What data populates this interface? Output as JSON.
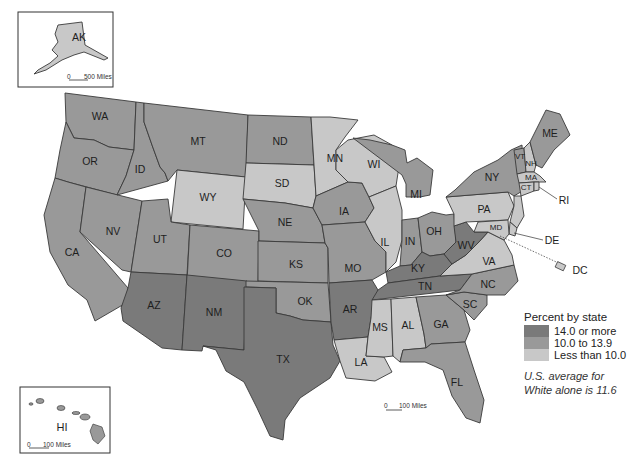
{
  "colors": {
    "high": "#7a7a7a",
    "mid": "#999999",
    "low": "#c8c8c8",
    "border": "#3a3a3a"
  },
  "legend": {
    "title": "Percent by state",
    "items": [
      {
        "label": "14.0 or more",
        "class": "high"
      },
      {
        "label": "10.0 to 13.9",
        "class": "mid"
      },
      {
        "label": "Less than 10.0",
        "class": "low"
      }
    ],
    "note_line1": "U.S. average for",
    "note_line2": "White alone is 11.6"
  },
  "insets": {
    "alaska": {
      "label": "AK",
      "scale": "500 Miles",
      "scale_zero": "0"
    },
    "hawaii": {
      "label": "HI",
      "scale": "100 Miles",
      "scale_zero": "0"
    }
  },
  "mainland_scale": {
    "zero": "0",
    "label": "100 Miles"
  },
  "chart_data": {
    "type": "choropleth",
    "title": "Percent by state",
    "note": "U.S. average for White alone is 11.6",
    "categories": [
      "14.0 or more",
      "10.0 to 13.9",
      "Less than 10.0"
    ],
    "states": {
      "AK": "Less than 10.0",
      "HI": "10.0 to 13.9",
      "WA": "10.0 to 13.9",
      "OR": "10.0 to 13.9",
      "CA": "10.0 to 13.9",
      "NV": "10.0 to 13.9",
      "ID": "10.0 to 13.9",
      "MT": "10.0 to 13.9",
      "WY": "Less than 10.0",
      "UT": "10.0 to 13.9",
      "CO": "10.0 to 13.9",
      "AZ": "14.0 or more",
      "NM": "14.0 or more",
      "ND": "10.0 to 13.9",
      "SD": "Less than 10.0",
      "NE": "10.0 to 13.9",
      "KS": "10.0 to 13.9",
      "OK": "10.0 to 13.9",
      "TX": "14.0 or more",
      "MN": "Less than 10.0",
      "IA": "10.0 to 13.9",
      "MO": "10.0 to 13.9",
      "AR": "14.0 or more",
      "LA": "Less than 10.0",
      "WI": "Less than 10.0",
      "IL": "Less than 10.0",
      "MI": "10.0 to 13.9",
      "IN": "10.0 to 13.9",
      "OH": "10.0 to 13.9",
      "KY": "14.0 or more",
      "TN": "14.0 or more",
      "MS": "Less than 10.0",
      "AL": "Less than 10.0",
      "GA": "10.0 to 13.9",
      "FL": "10.0 to 13.9",
      "SC": "10.0 to 13.9",
      "NC": "10.0 to 13.9",
      "VA": "Less than 10.0",
      "WV": "14.0 or more",
      "PA": "Less than 10.0",
      "NY": "10.0 to 13.9",
      "VT": "10.0 to 13.9",
      "NH": "Less than 10.0",
      "ME": "10.0 to 13.9",
      "MA": "Less than 10.0",
      "RI": "Less than 10.0",
      "CT": "Less than 10.0",
      "NJ": "Less than 10.0",
      "DE": "Less than 10.0",
      "MD": "Less than 10.0",
      "DC": "Less than 10.0"
    }
  },
  "states": [
    {
      "id": "WA",
      "cls": "mid",
      "pts": "65,93 136,102 134,150 109,147 94,140 74,138 66,122",
      "lx": 100,
      "ly": 117
    },
    {
      "id": "OR",
      "cls": "mid",
      "pts": "66,122 74,138 94,140 109,147 134,150 126,176 117,195 68,182 55,178 60,150",
      "lx": 90,
      "ly": 162
    },
    {
      "id": "CA",
      "cls": "mid",
      "pts": "55,178 68,182 86,187 80,232 128,288 126,303 95,321 87,300 68,285 50,252 44,215",
      "lx": 72,
      "ly": 253
    },
    {
      "id": "NV",
      "cls": "mid",
      "pts": "86,187 142,201 131,272 122,270 80,232",
      "lx": 113,
      "ly": 232
    },
    {
      "id": "ID",
      "cls": "mid",
      "pts": "136,102 144,103 144,122 152,145 160,167 165,173 168,181 117,195 126,176 134,150",
      "lx": 140,
      "ly": 170
    },
    {
      "id": "MT",
      "cls": "mid",
      "pts": "144,103 248,115 246,177 177,170 168,181 165,173 160,167 152,145 144,122",
      "lx": 198,
      "ly": 142
    },
    {
      "id": "WY",
      "cls": "low",
      "pts": "177,170 246,177 243,229 171,222",
      "lx": 208,
      "ly": 198
    },
    {
      "id": "UT",
      "cls": "mid",
      "pts": "142,201 168,199 171,222 190,225 187,275 131,272",
      "lx": 160,
      "ly": 240
    },
    {
      "id": "CO",
      "cls": "mid",
      "pts": "190,225 259,231 258,288 187,282",
      "lx": 224,
      "ly": 254
    },
    {
      "id": "AZ",
      "cls": "high",
      "pts": "131,272 187,275 182,350 162,348 123,321 121,308 128,288",
      "lx": 154,
      "ly": 306
    },
    {
      "id": "NM",
      "cls": "high",
      "pts": "187,275 247,281 244,350 203,346 202,351 182,350",
      "lx": 214,
      "ly": 313
    },
    {
      "id": "ND",
      "cls": "mid",
      "pts": "248,115 311,117 314,165 246,163",
      "lx": 280,
      "ly": 142
    },
    {
      "id": "SD",
      "cls": "low",
      "pts": "246,163 314,165 316,196 313,208 285,203 243,199",
      "lx": 282,
      "ly": 184
    },
    {
      "id": "NE",
      "cls": "mid",
      "pts": "243,199 285,203 313,208 322,225 325,243 259,241 259,231",
      "lx": 285,
      "ly": 223
    },
    {
      "id": "KS",
      "cls": "mid",
      "pts": "258,241 325,243 328,248 328,283 258,281",
      "lx": 296,
      "ly": 265
    },
    {
      "id": "OK",
      "cls": "mid",
      "pts": "246,281 328,283 331,322 303,320 290,316 276,313 276,288 246,287",
      "lx": 305,
      "ly": 302
    },
    {
      "id": "TX",
      "cls": "high",
      "pts": "244,287 276,288 276,313 290,316 303,320 331,322 333,345 340,361 330,378 300,398 285,420 283,440 270,436 257,408 244,382 226,371 216,350 203,346 244,350",
      "lx": 283,
      "ly": 360
    },
    {
      "id": "MN",
      "cls": "low",
      "pts": "311,117 330,117 358,120 345,137 336,150 336,170 348,182 316,196 314,165",
      "lx": 335,
      "ly": 159
    },
    {
      "id": "IA",
      "cls": "mid",
      "pts": "316,196 348,182 362,183 369,197 374,208 365,222 322,225 313,208",
      "lx": 344,
      "ly": 212
    },
    {
      "id": "MO",
      "cls": "mid",
      "pts": "322,225 365,222 375,241 386,252 386,272 372,280 329,283 328,248 325,243",
      "lx": 353,
      "ly": 269
    },
    {
      "id": "AR",
      "cls": "high",
      "pts": "329,283 372,280 378,290 371,318 368,337 334,340 331,322",
      "lx": 350,
      "ly": 310
    },
    {
      "id": "LA",
      "cls": "low",
      "pts": "334,340 368,337 366,356 384,357 392,372 375,381 346,378 340,361",
      "lx": 361,
      "ly": 363
    },
    {
      "id": "WI",
      "cls": "low",
      "pts": "348,140 374,135 392,145 400,160 396,186 369,197 362,183 348,182 336,170 336,150",
      "lx": 374,
      "ly": 165
    },
    {
      "id": "IL",
      "cls": "low",
      "pts": "369,197 396,186 402,210 402,240 396,262 386,272 386,252 375,241 365,222 374,208",
      "lx": 385,
      "ly": 243
    },
    {
      "id": "MI",
      "cls": "mid",
      "pts": "407,163 417,158 433,170 430,195 420,197 406,197 406,184 402,175 353,138 370,140 392,145 405,150",
      "lx": 416,
      "ly": 195
    },
    {
      "id": "IN",
      "cls": "mid",
      "pts": "402,220 418,218 422,252 411,265 400,266 402,240",
      "lx": 410,
      "ly": 242
    },
    {
      "id": "OH",
      "cls": "mid",
      "pts": "418,218 432,212 446,215 454,214 456,242 444,254 430,256 422,252",
      "lx": 434,
      "ly": 232
    },
    {
      "id": "KY",
      "cls": "high",
      "pts": "386,272 400,266 411,265 422,252 430,256 444,254 452,264 440,276 388,283",
      "lx": 418,
      "ly": 269
    },
    {
      "id": "TN",
      "cls": "high",
      "pts": "378,290 388,283 440,276 472,274 460,290 372,300",
      "lx": 425,
      "ly": 287
    },
    {
      "id": "MS",
      "cls": "low",
      "pts": "372,300 391,299 393,356 384,357 366,356 368,337 371,318",
      "lx": 380,
      "ly": 328
    },
    {
      "id": "AL",
      "cls": "low",
      "pts": "391,299 416,297 424,334 426,348 403,350 400,362 393,356",
      "lx": 408,
      "ly": 326
    },
    {
      "id": "GA",
      "cls": "mid",
      "pts": "416,297 446,295 464,310 470,330 465,342 431,344 426,348 424,334",
      "lx": 441,
      "ly": 325
    },
    {
      "id": "FL",
      "cls": "mid",
      "pts": "400,362 403,350 426,348 431,344 465,342 474,370 484,400 480,423 466,418 452,396 443,370 425,362",
      "lx": 457,
      "ly": 383
    },
    {
      "id": "SC",
      "cls": "mid",
      "pts": "446,295 464,292 487,295 487,305 474,320 464,310",
      "lx": 470,
      "ly": 305
    },
    {
      "id": "NC",
      "cls": "mid",
      "pts": "460,290 472,274 514,265 518,281 505,295 487,295 464,292 446,295",
      "lx": 488,
      "ly": 285
    },
    {
      "id": "VA",
      "cls": "low",
      "pts": "452,264 466,255 478,243 488,232 504,240 512,255 514,265 472,274 440,276",
      "lx": 489,
      "ly": 262
    },
    {
      "id": "WV",
      "cls": "high",
      "pts": "444,254 456,242 454,226 466,222 474,232 488,232 478,243 466,255 452,264",
      "lx": 466,
      "ly": 246
    },
    {
      "id": "PA",
      "cls": "low",
      "pts": "446,197 508,192 514,206 508,220 466,222 454,226 454,214",
      "lx": 484,
      "ly": 210
    },
    {
      "id": "NY",
      "cls": "mid",
      "pts": "455,190 474,172 498,160 511,150 522,145 524,190 514,196 508,192 446,197",
      "lx": 492,
      "ly": 178
    },
    {
      "id": "VT",
      "cls": "mid",
      "pts": "514,150 524,148 526,172 517,174",
      "lx": 520,
      "ly": 157
    },
    {
      "id": "NH",
      "cls": "low",
      "pts": "524,148 530,142 536,165 534,172 526,172",
      "lx": 531,
      "ly": 164
    },
    {
      "id": "ME",
      "cls": "mid",
      "pts": "530,142 546,110 560,114 570,135 554,150 542,168 536,165",
      "lx": 550,
      "ly": 134
    },
    {
      "id": "MA",
      "cls": "low",
      "pts": "517,174 526,172 534,172 540,176 546,182 534,182 519,183",
      "lx": 531,
      "ly": 178
    },
    {
      "id": "CT",
      "cls": "low",
      "pts": "519,183 534,182 534,191 521,196",
      "lx": 526,
      "ly": 188
    },
    {
      "id": "RI",
      "cls": "low",
      "pts": "534,182 539,182 539,190 534,191",
      "lx": 0,
      "ly": 0
    },
    {
      "id": "NJ",
      "cls": "low",
      "pts": "514,196 521,196 524,216 517,228 510,222 514,206",
      "lx": 0,
      "ly": 0
    },
    {
      "id": "DE",
      "cls": "low",
      "pts": "510,222 517,228 515,236 509,234",
      "lx": 0,
      "ly": 0
    },
    {
      "id": "MD",
      "cls": "low",
      "pts": "478,222 508,220 509,234 504,240 488,232 474,232",
      "lx": 496,
      "ly": 228
    }
  ],
  "callouts": [
    {
      "id": "RI",
      "text": "RI",
      "lx": 564,
      "ly": 201,
      "x1": 539,
      "y1": 187,
      "x2": 557,
      "y2": 199
    },
    {
      "id": "DE",
      "text": "DE",
      "lx": 552,
      "ly": 241,
      "x1": 514,
      "y1": 233,
      "x2": 543,
      "y2": 240
    },
    {
      "id": "DC",
      "text": "DC",
      "lx": 580,
      "ly": 271,
      "x1": 500,
      "y1": 236,
      "x2": 565,
      "y2": 266
    }
  ]
}
